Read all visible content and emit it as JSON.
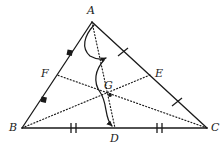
{
  "figure": {
    "width": 223,
    "height": 150,
    "background_color": "#ffffff",
    "stroke_color": "#1a1a1a",
    "labels": {
      "A": "A",
      "B": "B",
      "C": "C",
      "D": "D",
      "E": "E",
      "F": "F",
      "G": "G"
    },
    "points": {
      "A": {
        "x": 92,
        "y": 22
      },
      "B": {
        "x": 22,
        "y": 128
      },
      "C": {
        "x": 207,
        "y": 128
      },
      "D": {
        "x": 115,
        "y": 128
      },
      "E": {
        "x": 150,
        "y": 75
      },
      "F": {
        "x": 57,
        "y": 75
      },
      "G": {
        "x": 110,
        "y": 95
      }
    },
    "label_positions": {
      "A": {
        "x": 87,
        "y": 5
      },
      "B": {
        "x": 9,
        "y": 123
      },
      "C": {
        "x": 211,
        "y": 123
      },
      "D": {
        "x": 111,
        "y": 133
      },
      "E": {
        "x": 155,
        "y": 69
      },
      "F": {
        "x": 42,
        "y": 69
      },
      "G": {
        "x": 105,
        "y": 80
      }
    },
    "sides": [
      {
        "name": "side-AB",
        "from": "A",
        "to": "B",
        "style": "solid"
      },
      {
        "name": "side-AC",
        "from": "A",
        "to": "C",
        "style": "solid"
      },
      {
        "name": "side-BC",
        "from": "B",
        "to": "C",
        "style": "solid"
      }
    ],
    "medians": [
      {
        "name": "median-AD",
        "from": "A",
        "to": "D",
        "style": "dotted"
      },
      {
        "name": "median-BE",
        "from": "B",
        "to": "E",
        "style": "dotted"
      },
      {
        "name": "median-CF",
        "from": "C",
        "to": "F",
        "style": "dotted"
      }
    ],
    "tick_marks": [
      {
        "name": "tick-BD",
        "count": 2,
        "x": 73,
        "y": 128,
        "angle": 0
      },
      {
        "name": "tick-DC",
        "count": 2,
        "x": 159,
        "y": 128,
        "angle": 0
      },
      {
        "name": "tick-AE",
        "count": 1,
        "x": 123,
        "y": 52,
        "angle": 37
      },
      {
        "name": "tick-EC",
        "count": 1,
        "x": 177,
        "y": 102,
        "angle": 37
      }
    ],
    "square_markers": [
      {
        "name": "square-marker-AF",
        "x": 70,
        "y": 53
      },
      {
        "name": "square-marker-FB",
        "x": 44,
        "y": 100
      }
    ],
    "arc_arrows": [
      {
        "name": "arc-arrow-A-to-G",
        "start_x": 94,
        "start_y": 25,
        "end_x": 106,
        "end_y": 59
      },
      {
        "name": "arc-arrow-G-to-D",
        "start_x": 106,
        "start_y": 59,
        "end_x": 113,
        "end_y": 128
      }
    ]
  }
}
